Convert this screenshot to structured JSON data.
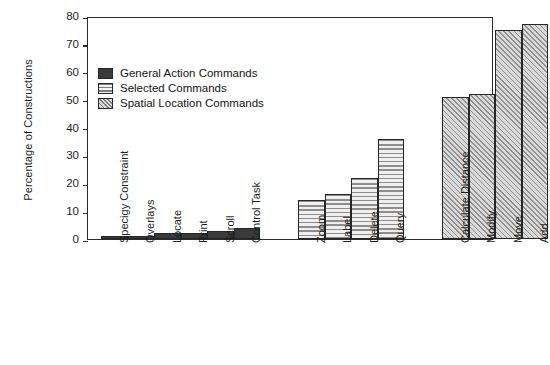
{
  "chart_data": {
    "type": "bar",
    "title": "",
    "xlabel": "",
    "ylabel": "Percentage of Constructions",
    "ylim": [
      0,
      80
    ],
    "yticks": [
      0,
      10,
      20,
      30,
      40,
      50,
      60,
      70,
      80
    ],
    "grid": false,
    "legend_position": "upper-left-inside",
    "categories": [
      "Specigy Constraint",
      "Overlays",
      "Locate",
      "Print",
      "Scroll",
      "Control Task",
      "Zoom",
      "Label",
      "Delete",
      "Query",
      "Calculate Distance",
      "Modify",
      "Move",
      "Add"
    ],
    "values": [
      1,
      1,
      2,
      2,
      3,
      4,
      14,
      16,
      22,
      36,
      51,
      52,
      75,
      77
    ],
    "groups": [
      {
        "name": "General Action Commands",
        "pattern": "solid",
        "categories": [
          "Specigy Constraint",
          "Overlays",
          "Locate",
          "Print",
          "Scroll",
          "Control Task"
        ],
        "values": [
          1,
          1,
          2,
          2,
          3,
          4
        ]
      },
      {
        "name": "Selected Commands",
        "pattern": "horizontal-stripes",
        "categories": [
          "Zoom",
          "Label",
          "Delete",
          "Query"
        ],
        "values": [
          14,
          16,
          22,
          36
        ]
      },
      {
        "name": "Spatial Location Commands",
        "pattern": "diagonal-hatch",
        "categories": [
          "Calculate Distance",
          "Modify",
          "Move",
          "Add"
        ],
        "values": [
          51,
          52,
          75,
          77
        ]
      }
    ],
    "legend": [
      {
        "label": "General Action Commands",
        "pattern": "solid"
      },
      {
        "label": "Selected Commands",
        "pattern": "horizontal-stripes"
      },
      {
        "label": "Spatial Location Commands",
        "pattern": "diagonal-hatch"
      }
    ]
  },
  "colors": {
    "solid_fill": "#3a3a3a",
    "stripe_fill": "#d8d8d8",
    "hatch_fill": "#c9c9c9",
    "axis": "#2a2a2a",
    "background": "#ffffff",
    "text": "#1d1d1d"
  }
}
